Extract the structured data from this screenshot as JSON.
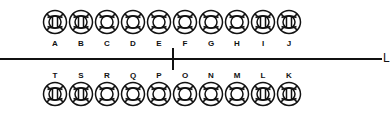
{
  "diagram": {
    "line_label": "L",
    "colors": {
      "stroke": "#111111",
      "background": "#ffffff"
    },
    "top_row": [
      {
        "label": "A",
        "type": "barred"
      },
      {
        "label": "B",
        "type": "barred"
      },
      {
        "label": "C",
        "type": "ring"
      },
      {
        "label": "D",
        "type": "ring"
      },
      {
        "label": "E",
        "type": "ring"
      },
      {
        "label": "F",
        "type": "ring"
      },
      {
        "label": "G",
        "type": "ring"
      },
      {
        "label": "H",
        "type": "ring"
      },
      {
        "label": "I",
        "type": "barred"
      },
      {
        "label": "J",
        "type": "barred"
      }
    ],
    "bottom_row": [
      {
        "label": "T",
        "type": "barred"
      },
      {
        "label": "S",
        "type": "barred"
      },
      {
        "label": "R",
        "type": "ring"
      },
      {
        "label": "Q",
        "type": "ring"
      },
      {
        "label": "P",
        "type": "ring"
      },
      {
        "label": "O",
        "type": "ring"
      },
      {
        "label": "N",
        "type": "ring"
      },
      {
        "label": "M",
        "type": "ring"
      },
      {
        "label": "L",
        "type": "barred"
      },
      {
        "label": "K",
        "type": "barred"
      }
    ]
  }
}
